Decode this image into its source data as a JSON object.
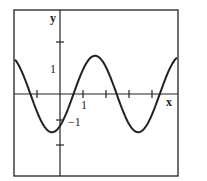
{
  "chart_data": {
    "type": "line",
    "title": "",
    "xlabel": "x",
    "ylabel": "y",
    "xlim": [
      -2.1,
      5.0
    ],
    "ylim": [
      -3.4,
      3.6
    ],
    "grid": false,
    "legend": null,
    "x_ticks": [
      -1,
      1,
      2,
      3,
      4
    ],
    "x_tick_labels": [
      {
        "value": 1,
        "label": "1"
      }
    ],
    "y_ticks": [
      2,
      -1,
      -2
    ],
    "y_tick_labels": [
      {
        "value": 1,
        "label": "1"
      },
      {
        "value": -1,
        "label": "−1"
      }
    ],
    "series": [
      {
        "name": "curve",
        "description": "sinusoid, amplitude ~1.5, period ~3.7, minimum near x=-0.35",
        "x": [
          -2.1,
          -1.5,
          -1.35,
          -1.0,
          -0.35,
          0,
          0.5,
          1.0,
          1.5,
          2.0,
          2.4,
          3.0,
          3.35,
          3.8,
          4.3,
          5.0
        ],
        "y": [
          1.0,
          0.3,
          0.0,
          -0.8,
          -1.5,
          -1.1,
          0.0,
          1.0,
          1.5,
          1.1,
          0.0,
          -1.2,
          -1.5,
          -1.0,
          0.0,
          1.0
        ]
      }
    ]
  },
  "labels": {
    "x_axis": "x",
    "y_axis": "y",
    "x_one": "1",
    "y_one": "1",
    "y_neg_one": "−1"
  }
}
